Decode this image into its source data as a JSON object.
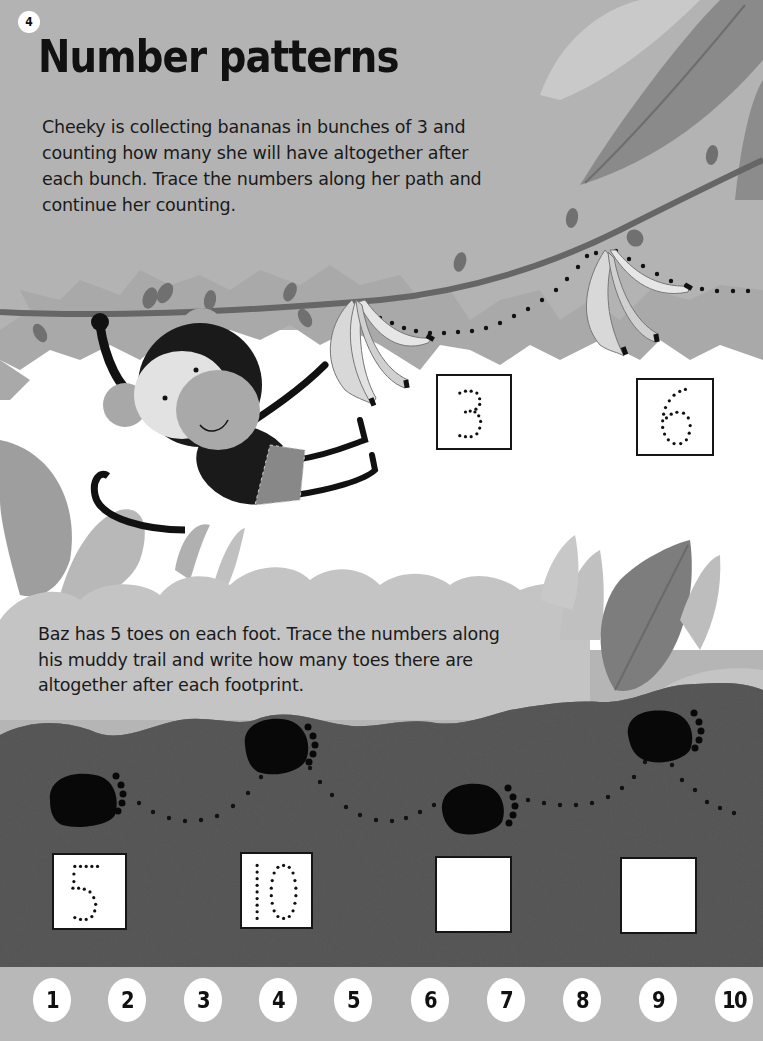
{
  "page": {
    "page_number": "4",
    "title": "Number patterns"
  },
  "section_bananas": {
    "character": "Cheeky",
    "instructions": "Cheeky is collecting bananas in bunches of 3 and counting how many she will have altogether after each bunch. Trace the numbers along her path and continue her counting.",
    "boxes": [
      {
        "value": "3",
        "style": "dotted-trace"
      },
      {
        "value": "6",
        "style": "dotted-trace"
      }
    ]
  },
  "section_footprints": {
    "character": "Baz",
    "instructions": "Baz has 5 toes on each foot. Trace the numbers along his muddy trail and write how many toes there are altogether after each footprint.",
    "boxes": [
      {
        "value": "5",
        "style": "dotted-trace"
      },
      {
        "value": "10",
        "style": "dotted-trace"
      },
      {
        "value": "",
        "style": "blank"
      },
      {
        "value": "",
        "style": "blank"
      }
    ]
  },
  "number_line": {
    "numbers": [
      "1",
      "2",
      "3",
      "4",
      "5",
      "6",
      "7",
      "8",
      "9",
      "10"
    ]
  },
  "colors": {
    "sky": "#b3b3b3",
    "white_band": "#ffffff",
    "mud": "#5a5a5a",
    "vine": "#6a6a6a",
    "ink": "#111111"
  }
}
